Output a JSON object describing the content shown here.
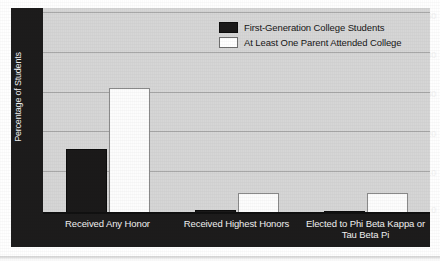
{
  "chart_data": {
    "type": "bar",
    "title": "",
    "subtitle": "",
    "xlabel": "",
    "ylabel": "Percentage of Students",
    "ylim": [
      0,
      50
    ],
    "yticks": [
      0,
      10,
      20,
      30,
      40,
      50
    ],
    "ytick_labels": [
      "0",
      "10",
      "20",
      "30",
      "40",
      "50"
    ],
    "grid": true,
    "grid_axis": "y",
    "legend_position": "upper center-right (inside plot)",
    "categories": [
      "Received Any Honor",
      "Received Highest Honors",
      "Elected to Phi Beta Kappa or Tau Beta Pi"
    ],
    "series": [
      {
        "name": "First-Generation College Students",
        "color": "#1b1a1a",
        "values": [
          16,
          0.7,
          0.5
        ]
      },
      {
        "name": "At Least One Parent Attended College",
        "color": "#ffffff",
        "values": [
          31,
          5,
          5
        ]
      }
    ],
    "annotations": []
  },
  "axis": {
    "y_title": "Percentage of Students",
    "y_ticks": [
      {
        "value": 50,
        "label": "50"
      },
      {
        "value": 40,
        "label": "40"
      },
      {
        "value": 30,
        "label": "30"
      },
      {
        "value": 20,
        "label": "20"
      },
      {
        "value": 10,
        "label": "10"
      },
      {
        "value": 0,
        "label": "0"
      }
    ],
    "x_categories": [
      {
        "line1": "Received Any Honor",
        "line2": ""
      },
      {
        "line1": "Received Highest Honors",
        "line2": ""
      },
      {
        "line1": "Elected to Phi Beta Kappa or",
        "line2": "Tau Beta Pi"
      }
    ]
  },
  "legend": {
    "items": [
      {
        "label": "First-Generation College Students",
        "swatch": "dark"
      },
      {
        "label": "At Least One Parent Attended College",
        "swatch": "light"
      }
    ]
  },
  "colors": {
    "plot_background": "#d6d6d6",
    "page_background": "#ffffff",
    "axis_band": "#1d1c1c",
    "gridline": "#a8a8a8",
    "series_dark": "#1b1a1a",
    "series_light": "#ffffff",
    "axis_text": "#f2f2f2",
    "legend_text": "#171717"
  }
}
